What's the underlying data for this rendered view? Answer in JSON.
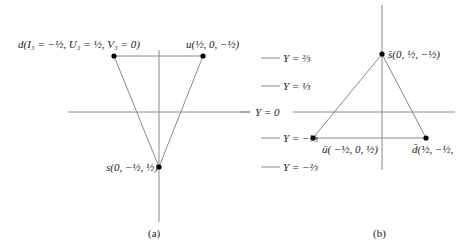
{
  "panel_a": {
    "caption": "(a)",
    "points": [
      {
        "name": "d",
        "label": "d(I₃ = −½, U₃ = ½, V₃ = 0)"
      },
      {
        "name": "u",
        "label": "u(½, 0, −½)"
      },
      {
        "name": "s",
        "label": "s(0, −½, ½)"
      }
    ]
  },
  "panel_b": {
    "caption": "(b)",
    "points": [
      {
        "name": "s-bar",
        "label": "s̄(0, ½, −½)"
      },
      {
        "name": "u-bar",
        "label": "ū( −½, 0, ½)"
      },
      {
        "name": "d-bar",
        "label": "d̄(½, −½,"
      }
    ],
    "levels": [
      {
        "label": "Y = ⅔"
      },
      {
        "label": "Y = ⅓"
      },
      {
        "label": "Y = 0"
      },
      {
        "label": "Y = −⅓"
      },
      {
        "label": "Y = −⅔"
      }
    ]
  },
  "colors": {
    "line": "#8a8a8a",
    "point": "#000000",
    "text": "#1a1a1a"
  }
}
